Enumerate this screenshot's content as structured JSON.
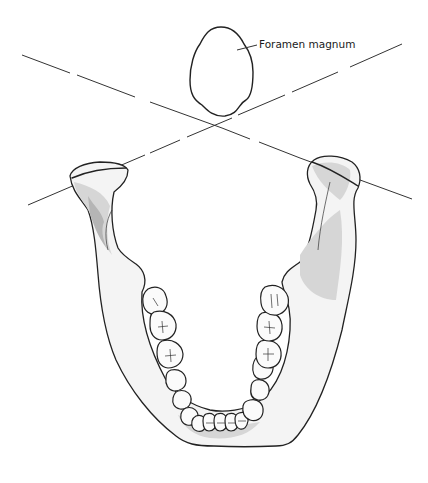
{
  "figure": {
    "labels": {
      "foramen_magnum": "Foramen magnum"
    },
    "colors": {
      "line": "#333333",
      "bone_fill": "#f4f4f4",
      "shading": "#d6d6d6",
      "outline": "#222222"
    },
    "elements": [
      "foramen-magnum-outline",
      "left-condylar-axis-line",
      "right-condylar-axis-line",
      "mandible",
      "lower-dentition"
    ]
  }
}
